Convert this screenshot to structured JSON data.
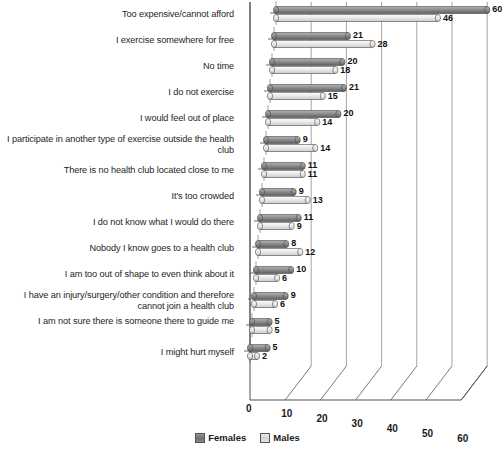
{
  "chart_data": {
    "type": "bar",
    "orientation": "horizontal",
    "title": "",
    "xlabel": "",
    "ylabel": "",
    "xlim": [
      0,
      60
    ],
    "xticks": [
      0,
      10,
      20,
      30,
      40,
      50,
      60
    ],
    "grid": true,
    "legend_position": "bottom",
    "style": "3d-cylinder",
    "categories": [
      "I might hurt myself",
      "I am not sure there is someone there to guide me",
      "I have an injury/surgery/other condition and therefore cannot join a health club",
      "I am too out of shape to even think about it",
      "Nobody I know goes to a health club",
      "I do not know what I would do there",
      "It's too crowded",
      "There is no health club located close to me",
      "I participate in another type of exercise outside the health club",
      "I would feel out of place",
      "I do not exercise",
      "No time",
      "I exercise somewhere for free",
      "Too expensive/cannot afford"
    ],
    "series": [
      {
        "name": "Females",
        "color": "#6f6f6f",
        "values": [
          5,
          5,
          9,
          10,
          8,
          11,
          9,
          11,
          9,
          20,
          21,
          20,
          21,
          60
        ]
      },
      {
        "name": "Males",
        "color": "#dcdcdc",
        "values": [
          2,
          5,
          6,
          6,
          12,
          9,
          13,
          11,
          14,
          14,
          15,
          18,
          28,
          46
        ]
      }
    ]
  },
  "legend": {
    "items": [
      {
        "label": "Females"
      },
      {
        "label": "Males"
      }
    ]
  }
}
